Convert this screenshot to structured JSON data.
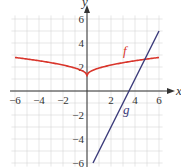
{
  "chart_data": {
    "type": "line",
    "title": "",
    "xlabel": "x",
    "ylabel": "y",
    "xlim": [
      -6.3,
      6.3
    ],
    "ylim": [
      -6.3,
      6.5
    ],
    "grid": true,
    "x_ticks": [
      "-6",
      "-4",
      "-2",
      "2",
      "4",
      "6"
    ],
    "y_ticks": [
      "6",
      "4",
      "2",
      "-2",
      "-4",
      "-6"
    ],
    "series": [
      {
        "name": "f",
        "color": "#d9352b",
        "x": [
          -6,
          -5,
          -4,
          -3,
          -2,
          -1,
          -0.5,
          0,
          0.5,
          1,
          2,
          3,
          4,
          5,
          6
        ],
        "y": [
          2.8,
          2.65,
          2.5,
          2.35,
          2.15,
          1.9,
          1.7,
          1.3,
          1.7,
          1.9,
          2.15,
          2.35,
          2.5,
          2.65,
          2.8
        ]
      },
      {
        "name": "g",
        "color": "#3a3a7a",
        "x": [
          0.5,
          6
        ],
        "y": [
          -6,
          5
        ]
      }
    ],
    "annotations": [
      {
        "text": "f",
        "x": 4.3,
        "y": 3.3
      },
      {
        "text": "g",
        "x": 4.1,
        "y": -1.5
      }
    ]
  },
  "labels": {
    "x_axis": "x",
    "y_axis": "y",
    "f": "f",
    "g": "g",
    "xt": [
      "−6",
      "−4",
      "−2",
      "2",
      "4",
      "6"
    ],
    "yt": [
      "6",
      "4",
      "2",
      "−2",
      "−4",
      "−6"
    ]
  }
}
